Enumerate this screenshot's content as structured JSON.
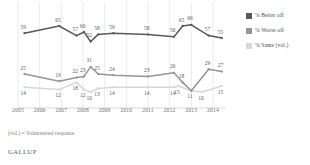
{
  "legend": {
    "position": "right",
    "items": [
      {
        "label": "% Better off",
        "color": "#58595b",
        "key": "better"
      },
      {
        "label": "% Worse off",
        "color": "#939598",
        "key": "worse"
      },
      {
        "label": "% Same (vol.)",
        "color": "#d6d7d9",
        "key": "same"
      }
    ]
  },
  "footnote": "(vol.) = Volunteered response",
  "brand": "GALLUP",
  "chart_data": {
    "type": "line",
    "title": "",
    "subtitle": "",
    "xlabel": "",
    "ylabel": "",
    "grid": "vertical-only",
    "ylim": [
      0,
      80
    ],
    "xlim": [
      2005,
      2014.6
    ],
    "axis_tick_labels": [
      "2005",
      "2006",
      "2007",
      "2008",
      "2009",
      "2010",
      "2011",
      "2012",
      "2013",
      "2014"
    ],
    "series": [
      {
        "name": "% Better off",
        "color": "#58595b",
        "points": [
          {
            "x": 2005.3,
            "y": 59,
            "label": "59"
          },
          {
            "x": 2006.9,
            "y": 65,
            "label": "65"
          },
          {
            "x": 2007.7,
            "y": 57,
            "label": "57"
          },
          {
            "x": 2008.05,
            "y": 60,
            "label": "60"
          },
          {
            "x": 2008.35,
            "y": 52,
            "label": "52"
          },
          {
            "x": 2008.7,
            "y": 58,
            "label": "58"
          },
          {
            "x": 2009.4,
            "y": 59,
            "label": "59"
          },
          {
            "x": 2011.0,
            "y": 58,
            "label": "58"
          },
          {
            "x": 2012.2,
            "y": 56,
            "label": "56"
          },
          {
            "x": 2012.6,
            "y": 65,
            "label": "65"
          },
          {
            "x": 2013.0,
            "y": 66,
            "label": "66"
          },
          {
            "x": 2013.8,
            "y": 57,
            "label": "57"
          },
          {
            "x": 2014.4,
            "y": 55,
            "label": "55"
          }
        ]
      },
      {
        "name": "% Worse off",
        "color": "#939598",
        "points": [
          {
            "x": 2005.3,
            "y": 25,
            "label": "25"
          },
          {
            "x": 2006.9,
            "y": 19,
            "label": "19"
          },
          {
            "x": 2007.7,
            "y": 22,
            "label": "22"
          },
          {
            "x": 2008.05,
            "y": 23,
            "label": "23"
          },
          {
            "x": 2008.35,
            "y": 31,
            "label": "31"
          },
          {
            "x": 2008.7,
            "y": 25,
            "label": "25"
          },
          {
            "x": 2009.4,
            "y": 24,
            "label": "24"
          },
          {
            "x": 2011.0,
            "y": 23,
            "label": "23"
          },
          {
            "x": 2012.2,
            "y": 26,
            "label": "26"
          },
          {
            "x": 2012.6,
            "y": 18,
            "label": "18"
          },
          {
            "x": 2013.0,
            "y": 11,
            "label": ""
          },
          {
            "x": 2013.8,
            "y": 29,
            "label": "29"
          },
          {
            "x": 2014.4,
            "y": 27,
            "label": "27"
          }
        ]
      },
      {
        "name": "% Same (vol.)",
        "color": "#d6d7d9",
        "points": [
          {
            "x": 2005.3,
            "y": 14,
            "label": "14"
          },
          {
            "x": 2006.9,
            "y": 12,
            "label": "12"
          },
          {
            "x": 2007.7,
            "y": 18,
            "label": "18"
          },
          {
            "x": 2008.05,
            "y": 12,
            "label": "12"
          },
          {
            "x": 2008.35,
            "y": 10,
            "label": "10"
          },
          {
            "x": 2008.7,
            "y": 13,
            "label": "13"
          },
          {
            "x": 2009.4,
            "y": 14,
            "label": "14"
          },
          {
            "x": 2011.0,
            "y": 14,
            "label": "14"
          },
          {
            "x": 2012.2,
            "y": 14,
            "label": "14"
          },
          {
            "x": 2012.4,
            "y": 15,
            "label": "15"
          },
          {
            "x": 2013.0,
            "y": 11,
            "label": "11"
          },
          {
            "x": 2013.5,
            "y": 10,
            "label": "10"
          },
          {
            "x": 2014.4,
            "y": 15,
            "label": "15"
          }
        ]
      }
    ]
  }
}
